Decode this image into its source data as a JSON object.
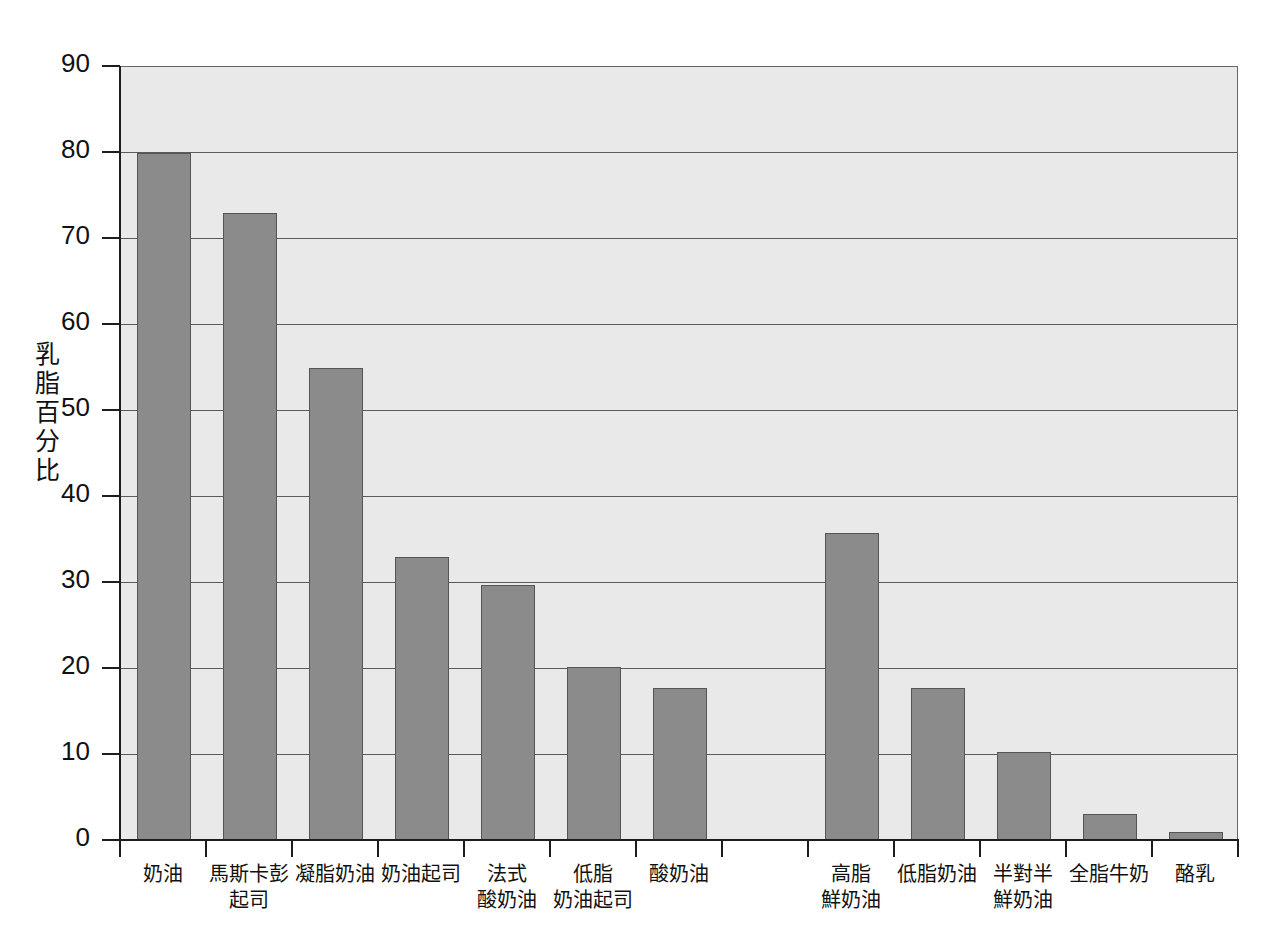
{
  "chart_data": {
    "type": "bar",
    "title": "",
    "xlabel": "",
    "ylabel": "乳脂百分比",
    "ylim": [
      0,
      90
    ],
    "ytick_step": 10,
    "grid": true,
    "legend": "none",
    "bar_color": "#8b8b8b",
    "bar_edge_color": "#555555",
    "plot_background": "#e9e9e9",
    "axis_color": "#1d1d1d",
    "ytick_labels": [
      "0",
      "10",
      "20",
      "30",
      "40",
      "50",
      "60",
      "70",
      "80",
      "90"
    ],
    "categories": [
      "奶油",
      "馬斯卡彭\n起司",
      "凝脂奶油",
      "奶油起司",
      "法式\n酸奶油",
      "低脂\n奶油起司",
      "酸奶油",
      "",
      "高脂\n鮮奶油",
      "低脂奶油",
      "半對半\n鮮奶油",
      "全脂牛奶",
      "酪乳"
    ],
    "values": [
      80,
      73,
      55,
      33,
      29.8,
      20.2,
      17.8,
      null,
      35.8,
      17.8,
      10.4,
      3.1,
      1.0
    ]
  },
  "axis": {
    "y_title": "乳脂百分比"
  }
}
